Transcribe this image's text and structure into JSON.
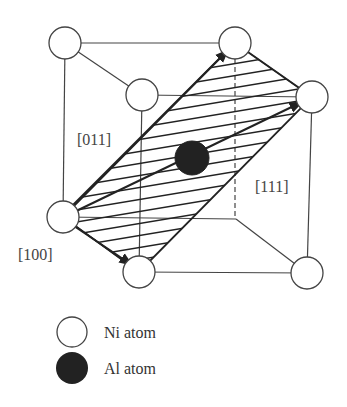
{
  "diagram": {
    "labels": {
      "dir_011": "[011]",
      "dir_111": "[111]",
      "dir_100": "[100]"
    },
    "legend": {
      "ni": "Ni atom",
      "al": "Al atom"
    },
    "colors": {
      "line": "#444444",
      "ni_fill": "#ffffff",
      "al_fill": "#222222",
      "background": "#ffffff"
    }
  }
}
